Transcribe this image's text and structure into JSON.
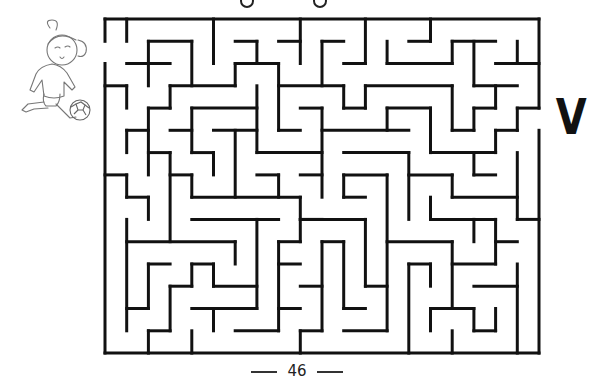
{
  "page": {
    "page_number": "46",
    "exit_label": "V"
  },
  "maze": {
    "stroke_color": "#111111",
    "stroke_width": 3,
    "origin": [
      105,
      19
    ],
    "cell_w": 21.7,
    "cell_h": 22.27,
    "cols": 20,
    "rows": 15,
    "entrance": {
      "side": "left",
      "row": 1
    },
    "exit": {
      "side": "right",
      "row": 4
    },
    "walls": [
      [
        0,
        0,
        20,
        0
      ],
      [
        0,
        0,
        0,
        1
      ],
      [
        0,
        2,
        0,
        15
      ],
      [
        0,
        15,
        20,
        15
      ],
      [
        20,
        0,
        20,
        4
      ],
      [
        20,
        5,
        20,
        15
      ],
      [
        1,
        0,
        1,
        1
      ],
      [
        2,
        1,
        4,
        1
      ],
      [
        2,
        1,
        2,
        3
      ],
      [
        4,
        1,
        4,
        3
      ],
      [
        1,
        2,
        3,
        2
      ],
      [
        5,
        0,
        5,
        2
      ],
      [
        6,
        1,
        7,
        1
      ],
      [
        7,
        1,
        7,
        2
      ],
      [
        6,
        2,
        8,
        2
      ],
      [
        6,
        2,
        6,
        3
      ],
      [
        8,
        2,
        8,
        5
      ],
      [
        9,
        0,
        9,
        2
      ],
      [
        8,
        1,
        9,
        1
      ],
      [
        10,
        1,
        11,
        1
      ],
      [
        10,
        1,
        10,
        3
      ],
      [
        12,
        0,
        12,
        2
      ],
      [
        11,
        2,
        12,
        2
      ],
      [
        13,
        1,
        13,
        2
      ],
      [
        13,
        2,
        16,
        2
      ],
      [
        16,
        1,
        16,
        2
      ],
      [
        16,
        1,
        18,
        1
      ],
      [
        17,
        1,
        17,
        3
      ],
      [
        15,
        0,
        15,
        1
      ],
      [
        14,
        1,
        15,
        1
      ],
      [
        19,
        1,
        19,
        2
      ],
      [
        18,
        2,
        20,
        2
      ],
      [
        0,
        3,
        1,
        3
      ],
      [
        1,
        3,
        1,
        4
      ],
      [
        3,
        3,
        6,
        3
      ],
      [
        3,
        3,
        3,
        4
      ],
      [
        2,
        4,
        3,
        4
      ],
      [
        2,
        4,
        2,
        7
      ],
      [
        4,
        4,
        7,
        4
      ],
      [
        4,
        4,
        4,
        6
      ],
      [
        7,
        3,
        7,
        6
      ],
      [
        8,
        3,
        11,
        3
      ],
      [
        11,
        3,
        11,
        4
      ],
      [
        11,
        4,
        12,
        4
      ],
      [
        12,
        3,
        16,
        3
      ],
      [
        12,
        3,
        12,
        4
      ],
      [
        16,
        3,
        16,
        5
      ],
      [
        16,
        5,
        17,
        5
      ],
      [
        17,
        4,
        17,
        5
      ],
      [
        17,
        4,
        18,
        4
      ],
      [
        18,
        3,
        18,
        4
      ],
      [
        17,
        3,
        19,
        3
      ],
      [
        13,
        4,
        15,
        4
      ],
      [
        13,
        4,
        13,
        5
      ],
      [
        15,
        4,
        15,
        6
      ],
      [
        15,
        6,
        18,
        6
      ],
      [
        18,
        5,
        18,
        6
      ],
      [
        18,
        5,
        19,
        5
      ],
      [
        19,
        4,
        19,
        5
      ],
      [
        19,
        4,
        20,
        4
      ],
      [
        9,
        4,
        10,
        4
      ],
      [
        10,
        4,
        10,
        8
      ],
      [
        8,
        5,
        9,
        5
      ],
      [
        10,
        5,
        14,
        5
      ],
      [
        1,
        5,
        2,
        5
      ],
      [
        1,
        5,
        1,
        6
      ],
      [
        3,
        5,
        4,
        5
      ],
      [
        4,
        6,
        5,
        6
      ],
      [
        5,
        6,
        5,
        7
      ],
      [
        5,
        5,
        7,
        5
      ],
      [
        6,
        5,
        6,
        8
      ],
      [
        2,
        6,
        3,
        6
      ],
      [
        3,
        6,
        3,
        10
      ],
      [
        0,
        7,
        1,
        7
      ],
      [
        1,
        7,
        1,
        8
      ],
      [
        1,
        8,
        2,
        8
      ],
      [
        2,
        8,
        2,
        9
      ],
      [
        3,
        7,
        4,
        7
      ],
      [
        4,
        7,
        4,
        8
      ],
      [
        4,
        8,
        9,
        8
      ],
      [
        8,
        7,
        8,
        8
      ],
      [
        9,
        8,
        9,
        10
      ],
      [
        9,
        9,
        10,
        9
      ],
      [
        4,
        9,
        8,
        9
      ],
      [
        7,
        9,
        7,
        13
      ],
      [
        1,
        9,
        1,
        14
      ],
      [
        1,
        10,
        6,
        10
      ],
      [
        6,
        10,
        6,
        11
      ],
      [
        8,
        10,
        9,
        10
      ],
      [
        8,
        10,
        8,
        14
      ],
      [
        7,
        6,
        10,
        6
      ],
      [
        7,
        7,
        8,
        7
      ],
      [
        9,
        7,
        10,
        7
      ],
      [
        11,
        6,
        14,
        6
      ],
      [
        11,
        7,
        13,
        7
      ],
      [
        11,
        7,
        11,
        8
      ],
      [
        11,
        8,
        12,
        8
      ],
      [
        14,
        6,
        14,
        9
      ],
      [
        14,
        7,
        16,
        7
      ],
      [
        16,
        7,
        16,
        8
      ],
      [
        16,
        8,
        19,
        8
      ],
      [
        17,
        6,
        17,
        7
      ],
      [
        17,
        7,
        18,
        7
      ],
      [
        19,
        6,
        19,
        9
      ],
      [
        19,
        9,
        20,
        9
      ],
      [
        13,
        7,
        13,
        14
      ],
      [
        15,
        8,
        15,
        9
      ],
      [
        15,
        9,
        18,
        9
      ],
      [
        17,
        9,
        17,
        10
      ],
      [
        18,
        9,
        18,
        11
      ],
      [
        9,
        9,
        12,
        9
      ],
      [
        12,
        9,
        12,
        12
      ],
      [
        12,
        12,
        13,
        12
      ],
      [
        10,
        10,
        11,
        10
      ],
      [
        10,
        10,
        10,
        14
      ],
      [
        11,
        10,
        11,
        13
      ],
      [
        11,
        13,
        12,
        13
      ],
      [
        11,
        14,
        13,
        14
      ],
      [
        13,
        10,
        16,
        10
      ],
      [
        16,
        10,
        16,
        13
      ],
      [
        16,
        11,
        18,
        11
      ],
      [
        18,
        10,
        19,
        10
      ],
      [
        14,
        11,
        14,
        15
      ],
      [
        14,
        11,
        15,
        11
      ],
      [
        15,
        11,
        15,
        12
      ],
      [
        15,
        13,
        17,
        13
      ],
      [
        15,
        13,
        15,
        14
      ],
      [
        17,
        13,
        17,
        14
      ],
      [
        17,
        14,
        18,
        14
      ],
      [
        18,
        13,
        18,
        14
      ],
      [
        16,
        14,
        16,
        15
      ],
      [
        17,
        12,
        19,
        12
      ],
      [
        19,
        11,
        19,
        15
      ],
      [
        2,
        11,
        3,
        11
      ],
      [
        2,
        11,
        2,
        13
      ],
      [
        1,
        13,
        2,
        13
      ],
      [
        4,
        11,
        5,
        11
      ],
      [
        4,
        11,
        4,
        12
      ],
      [
        5,
        11,
        5,
        12
      ],
      [
        3,
        12,
        4,
        12
      ],
      [
        5,
        12,
        7,
        12
      ],
      [
        3,
        12,
        3,
        14
      ],
      [
        2,
        14,
        3,
        14
      ],
      [
        2,
        14,
        2,
        15
      ],
      [
        4,
        14,
        4,
        15
      ],
      [
        4,
        13,
        7,
        13
      ],
      [
        5,
        13,
        5,
        14
      ],
      [
        6,
        14,
        8,
        14
      ],
      [
        8,
        11,
        9,
        11
      ],
      [
        8,
        13,
        9,
        13
      ],
      [
        9,
        12,
        10,
        12
      ],
      [
        9,
        14,
        10,
        14
      ],
      [
        9,
        14,
        9,
        15
      ]
    ]
  },
  "illustration": {
    "subject": "girl-kicking-soccer-ball",
    "line_color": "#777777"
  },
  "title_fragments": [
    {
      "x": 243
    },
    {
      "x": 316
    }
  ]
}
